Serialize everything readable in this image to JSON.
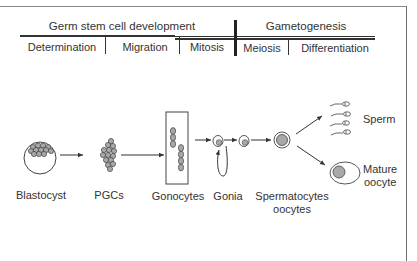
{
  "header": {
    "group_left": "Germ stem cell development",
    "group_right": "Gametogenesis",
    "phases": [
      "Determination",
      "Migration",
      "Mitosis",
      "Meiosis",
      "Differentiation"
    ]
  },
  "stages": [
    {
      "label": "Blastocyst"
    },
    {
      "label": "PGCs"
    },
    {
      "label": "Gonocytes"
    },
    {
      "label": "Gonia"
    },
    {
      "label": "Spermatocytes",
      "label2": "oocytes"
    }
  ],
  "outcomes": {
    "sperm": "Sperm",
    "oocyte_line1": "Mature",
    "oocyte_line2": "oocyte"
  },
  "colors": {
    "line": "#333333",
    "cell_fill": "#b0b0b0",
    "cell_stroke": "#555555"
  }
}
